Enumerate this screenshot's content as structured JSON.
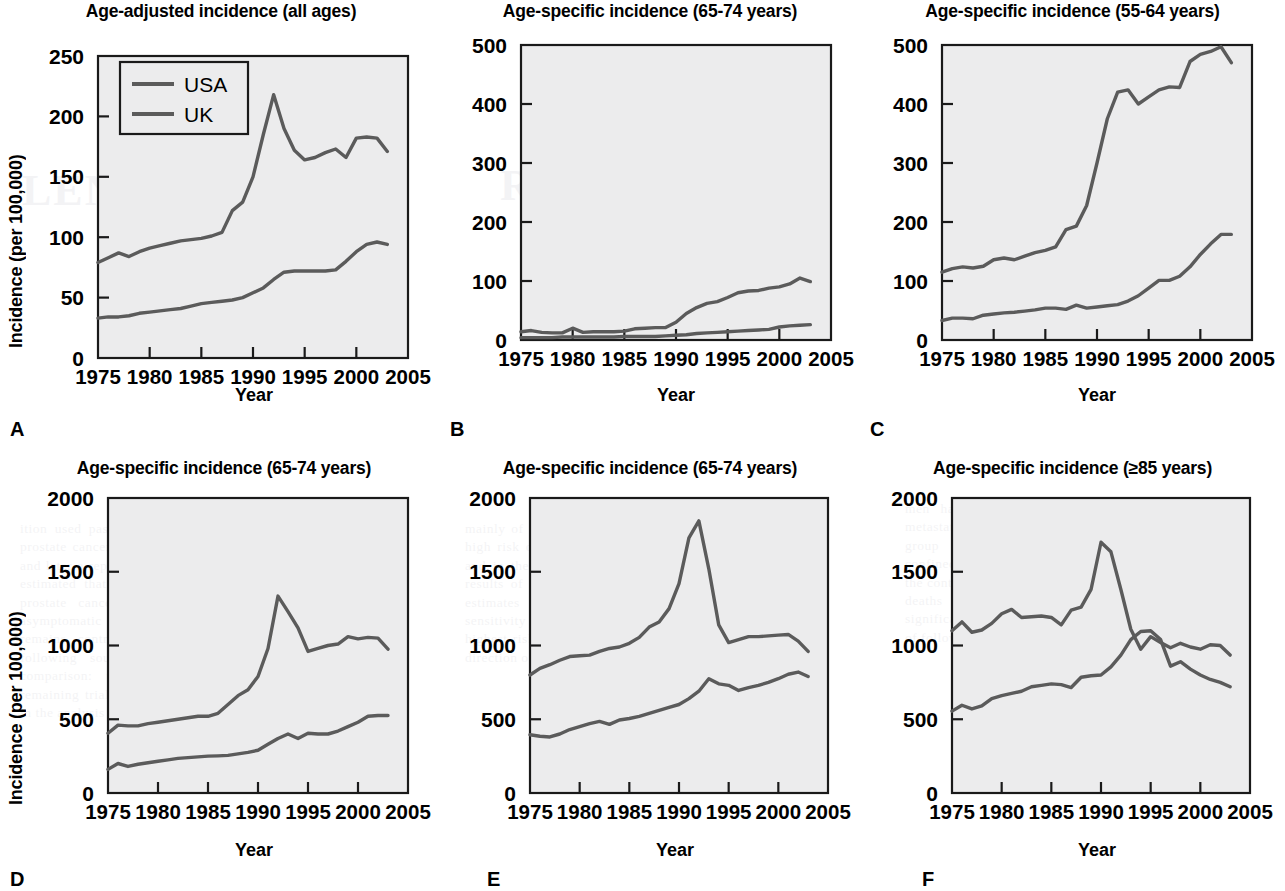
{
  "figure": {
    "axis_labels": {
      "y": "Incidence (per 100,000)",
      "x": "Year"
    },
    "legend": {
      "series": [
        "USA",
        "UK"
      ],
      "panel": "A"
    },
    "colors": {
      "line": "#5b5b5b",
      "plot_background": "#ececed",
      "frame": "#1a1a1a"
    }
  },
  "bleed_text": {
    "word1": "RESULTS FOR",
    "word2": "PROSTATE C",
    "word3": "LENINGS FOR",
    "p1": "ition used past presents national mortality from prostate cancer in the USA was reported in 1998 and later a report of the American Cancer Society estimated that 30 000 men in the USA die of prostate cancer each year. Routine screening asymptomatic men with serum PSA measurement remains controversial and evidence from the following sources is considered a basis of comparison: the randomised trials, and the remaining trials with relevant data were included in the analysis of overall effect.",
    "p2": "mainly of the trials assessed in the review had a high risk of bias in the randomisation procedure and in the blinding of outcome assessment. The results of each trial are summarised and pooled estimates are reported where appropriate. A sensitivity analysis excluding the studies at highest risk of bias did not materially change the direction of the estimated effect size.",
    "p3": "men had presented with locally advanced or metastatic disease at diagnosis. In the screened group the proportion diagnosed with organ-confined disease was considerably higher than in the control group, although the absolute number of deaths from prostate cancer did not differ significantly between the two arms over the period of follow-up reported."
  },
  "chart_data": [
    {
      "id": "A",
      "panel_letter": "A",
      "type": "line",
      "title": "Age-adjusted incidence (all ages)",
      "xlabel": "Year",
      "ylabel": "Incidence (per 100,000)",
      "xlim": [
        1975,
        2005
      ],
      "ylim": [
        0,
        250
      ],
      "yticks": [
        0,
        50,
        100,
        150,
        200,
        250
      ],
      "xticks": [
        1975,
        1980,
        1985,
        1990,
        1995,
        2000,
        2005
      ],
      "grid": false,
      "legend": [
        "USA",
        "UK"
      ],
      "legend_position": "top-left",
      "x": [
        1975,
        1976,
        1977,
        1978,
        1979,
        1980,
        1981,
        1982,
        1983,
        1984,
        1985,
        1986,
        1987,
        1988,
        1989,
        1990,
        1991,
        1992,
        1993,
        1994,
        1995,
        1996,
        1997,
        1998,
        1999,
        2000,
        2001,
        2002,
        2003
      ],
      "series": [
        {
          "name": "USA",
          "values": [
            79,
            83,
            87,
            84,
            88,
            91,
            93,
            95,
            97,
            98,
            99,
            101,
            104,
            122,
            129,
            150,
            185,
            218,
            190,
            172,
            164,
            166,
            170,
            173,
            166,
            182,
            183,
            182,
            171
          ]
        },
        {
          "name": "UK",
          "values": [
            33,
            34,
            34,
            35,
            37,
            38,
            39,
            40,
            41,
            43,
            45,
            46,
            47,
            48,
            50,
            54,
            58,
            65,
            71,
            72,
            72,
            72,
            72,
            73,
            80,
            88,
            94,
            96,
            94
          ]
        }
      ]
    },
    {
      "id": "B",
      "panel_letter": "B",
      "type": "line",
      "title": "Age-specific incidence (65-74 years)",
      "xlabel": "Year",
      "ylabel": "",
      "xlim": [
        1975,
        2005
      ],
      "ylim": [
        0,
        500
      ],
      "yticks": [
        0,
        100,
        200,
        300,
        400,
        500
      ],
      "xticks": [
        1975,
        1980,
        1985,
        1990,
        1995,
        2000,
        2005
      ],
      "grid": false,
      "x": [
        1975,
        1976,
        1977,
        1978,
        1979,
        1980,
        1981,
        1982,
        1983,
        1984,
        1985,
        1986,
        1987,
        1988,
        1989,
        1990,
        1991,
        1992,
        1993,
        1994,
        1995,
        1996,
        1997,
        1998,
        1999,
        2000,
        2001,
        2002,
        2003
      ],
      "series": [
        {
          "name": "USA",
          "values": [
            14,
            16,
            13,
            12,
            12,
            20,
            13,
            14,
            14,
            14,
            15,
            19,
            20,
            21,
            21,
            30,
            45,
            55,
            62,
            65,
            72,
            80,
            83,
            84,
            88,
            90,
            95,
            105,
            99
          ]
        },
        {
          "name": "UK",
          "values": [
            4,
            4,
            4,
            4,
            5,
            5,
            5,
            5,
            5,
            5,
            6,
            6,
            6,
            6,
            7,
            8,
            9,
            11,
            12,
            13,
            14,
            15,
            16,
            17,
            18,
            22,
            24,
            25,
            26
          ]
        }
      ]
    },
    {
      "id": "C",
      "panel_letter": "C",
      "type": "line",
      "title": "Age-specific incidence (55-64 years)",
      "xlabel": "Year",
      "ylabel": "",
      "xlim": [
        1975,
        2005
      ],
      "ylim": [
        0,
        500
      ],
      "yticks": [
        0,
        100,
        200,
        300,
        400,
        500
      ],
      "xticks": [
        1975,
        1980,
        1985,
        1990,
        1995,
        2000,
        2005
      ],
      "grid": false,
      "x": [
        1975,
        1976,
        1977,
        1978,
        1979,
        1980,
        1981,
        1982,
        1983,
        1984,
        1985,
        1986,
        1987,
        1988,
        1989,
        1990,
        1991,
        1992,
        1993,
        1994,
        1995,
        1996,
        1997,
        1998,
        1999,
        2000,
        2001,
        2002,
        2003
      ],
      "series": [
        {
          "name": "USA",
          "values": [
            115,
            121,
            124,
            122,
            125,
            136,
            139,
            136,
            142,
            148,
            152,
            158,
            187,
            193,
            228,
            300,
            375,
            420,
            424,
            400,
            412,
            424,
            429,
            428,
            472,
            484,
            489,
            497,
            470
          ]
        },
        {
          "name": "UK",
          "values": [
            33,
            37,
            37,
            36,
            42,
            44,
            46,
            47,
            49,
            51,
            54,
            54,
            52,
            59,
            54,
            56,
            58,
            60,
            66,
            75,
            88,
            101,
            101,
            108,
            124,
            145,
            163,
            179,
            179
          ]
        }
      ]
    },
    {
      "id": "D",
      "panel_letter": "D",
      "type": "line",
      "title": "Age-specific incidence (65-74 years)",
      "xlabel": "Year",
      "ylabel": "Incidence (per 100,000)",
      "xlim": [
        1975,
        2005
      ],
      "ylim": [
        0,
        2000
      ],
      "yticks": [
        0,
        500,
        1000,
        1500,
        2000
      ],
      "xticks": [
        1975,
        1980,
        1985,
        1990,
        1995,
        2000,
        2005
      ],
      "grid": false,
      "x": [
        1975,
        1976,
        1977,
        1978,
        1979,
        1980,
        1981,
        1982,
        1983,
        1984,
        1985,
        1986,
        1987,
        1988,
        1989,
        1990,
        1991,
        1992,
        1993,
        1994,
        1995,
        1996,
        1997,
        1998,
        1999,
        2000,
        2001,
        2002,
        2003
      ],
      "series": [
        {
          "name": "USA",
          "values": [
            405,
            460,
            455,
            455,
            470,
            480,
            490,
            500,
            510,
            520,
            520,
            540,
            600,
            660,
            700,
            790,
            980,
            1335,
            1230,
            1120,
            960,
            980,
            1000,
            1010,
            1060,
            1045,
            1055,
            1050,
            975
          ]
        },
        {
          "name": "UK",
          "values": [
            160,
            200,
            180,
            195,
            205,
            215,
            225,
            235,
            240,
            245,
            250,
            252,
            255,
            265,
            275,
            290,
            330,
            370,
            400,
            370,
            405,
            400,
            400,
            420,
            450,
            480,
            520,
            525,
            525
          ]
        }
      ]
    },
    {
      "id": "E",
      "panel_letter": "E",
      "type": "line",
      "title": "Age-specific incidence (65-74 years)",
      "xlabel": "Year",
      "ylabel": "",
      "xlim": [
        1975,
        2005
      ],
      "ylim": [
        0,
        2000
      ],
      "yticks": [
        0,
        500,
        1000,
        1500,
        2000
      ],
      "xticks": [
        1975,
        1980,
        1985,
        1990,
        1995,
        2000,
        2005
      ],
      "grid": false,
      "x": [
        1975,
        1976,
        1977,
        1978,
        1979,
        1980,
        1981,
        1982,
        1983,
        1984,
        1985,
        1986,
        1987,
        1988,
        1989,
        1990,
        1991,
        1992,
        1993,
        1994,
        1995,
        1996,
        1997,
        1998,
        1999,
        2000,
        2001,
        2002,
        2003
      ],
      "series": [
        {
          "name": "USA",
          "values": [
            800,
            845,
            870,
            900,
            925,
            930,
            935,
            960,
            980,
            990,
            1015,
            1055,
            1125,
            1160,
            1250,
            1420,
            1730,
            1845,
            1520,
            1140,
            1020,
            1040,
            1060,
            1060,
            1065,
            1070,
            1075,
            1030,
            960
          ]
        },
        {
          "name": "UK",
          "values": [
            395,
            385,
            380,
            400,
            430,
            450,
            470,
            485,
            465,
            495,
            505,
            520,
            540,
            560,
            580,
            600,
            640,
            690,
            775,
            740,
            730,
            695,
            715,
            730,
            750,
            775,
            805,
            820,
            790
          ]
        }
      ]
    },
    {
      "id": "F",
      "panel_letter": "F",
      "type": "line",
      "title": "Age-specific incidence (≥85 years)",
      "xlabel": "Year",
      "ylabel": "",
      "xlim": [
        1975,
        2005
      ],
      "ylim": [
        0,
        2000
      ],
      "yticks": [
        0,
        500,
        1000,
        1500,
        2000
      ],
      "xticks": [
        1975,
        1980,
        1985,
        1990,
        1995,
        2000,
        2005
      ],
      "grid": false,
      "x": [
        1975,
        1976,
        1977,
        1978,
        1979,
        1980,
        1981,
        1982,
        1983,
        1984,
        1985,
        1986,
        1987,
        1988,
        1989,
        1990,
        1991,
        1992,
        1993,
        1994,
        1995,
        1996,
        1997,
        1998,
        1999,
        2000,
        2001,
        2002,
        2003
      ],
      "series": [
        {
          "name": "USA",
          "values": [
            1100,
            1160,
            1090,
            1105,
            1150,
            1215,
            1245,
            1190,
            1195,
            1200,
            1190,
            1140,
            1240,
            1260,
            1380,
            1700,
            1635,
            1380,
            1110,
            975,
            1060,
            1020,
            985,
            1015,
            990,
            975,
            1005,
            1000,
            935
          ]
        },
        {
          "name": "UK",
          "values": [
            555,
            595,
            570,
            590,
            640,
            660,
            675,
            690,
            720,
            730,
            740,
            735,
            715,
            785,
            795,
            800,
            855,
            935,
            1040,
            1095,
            1100,
            1040,
            860,
            890,
            840,
            800,
            770,
            750,
            720
          ]
        }
      ]
    }
  ]
}
